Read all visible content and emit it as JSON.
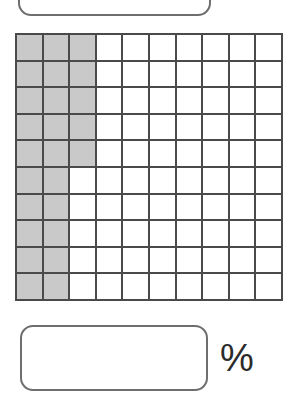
{
  "top_answer": {
    "value": "",
    "placeholder": ""
  },
  "answer": {
    "value": "",
    "placeholder": "",
    "unit_symbol": "%"
  },
  "colors": {
    "shaded_cell": "#c9c9c9",
    "empty_cell": "#ffffff",
    "grid_line": "#4a4a4a",
    "box_border": "#6e6e6e"
  },
  "chart_data": {
    "type": "heatmap",
    "title": "",
    "subtitle": "",
    "xlabel": "",
    "ylabel": "",
    "rows": 10,
    "cols": 10,
    "total_cells": 100,
    "shaded_cells": 25,
    "shaded_percent": 25,
    "legend": [
      {
        "label": "shaded",
        "color": "#c9c9c9",
        "value": 1
      },
      {
        "label": "unshaded",
        "color": "#ffffff",
        "value": 0
      }
    ],
    "legend_position": "none",
    "grid": true,
    "values": [
      [
        1,
        1,
        1,
        0,
        0,
        0,
        0,
        0,
        0,
        0
      ],
      [
        1,
        1,
        1,
        0,
        0,
        0,
        0,
        0,
        0,
        0
      ],
      [
        1,
        1,
        1,
        0,
        0,
        0,
        0,
        0,
        0,
        0
      ],
      [
        1,
        1,
        1,
        0,
        0,
        0,
        0,
        0,
        0,
        0
      ],
      [
        1,
        1,
        1,
        0,
        0,
        0,
        0,
        0,
        0,
        0
      ],
      [
        1,
        1,
        0,
        0,
        0,
        0,
        0,
        0,
        0,
        0
      ],
      [
        1,
        1,
        0,
        0,
        0,
        0,
        0,
        0,
        0,
        0
      ],
      [
        1,
        1,
        0,
        0,
        0,
        0,
        0,
        0,
        0,
        0
      ],
      [
        1,
        1,
        0,
        0,
        0,
        0,
        0,
        0,
        0,
        0
      ],
      [
        1,
        1,
        0,
        0,
        0,
        0,
        0,
        0,
        0,
        0
      ]
    ]
  }
}
